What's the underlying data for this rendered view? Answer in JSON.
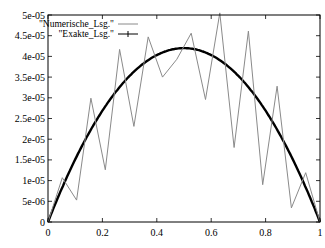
{
  "chart_data": {
    "type": "line",
    "title": "",
    "xlabel": "",
    "ylabel": "",
    "xlim": [
      0,
      1
    ],
    "ylim": [
      0,
      5e-05
    ],
    "grid": false,
    "legend_position": "top-left (inside)",
    "x_ticks": [
      0,
      0.2,
      0.4,
      0.6,
      0.8,
      1
    ],
    "x_tick_labels": [
      "0",
      "0.2",
      "0.4",
      "0.6",
      "0.8",
      "1"
    ],
    "y_ticks": [
      0,
      5e-06,
      1e-05,
      1.5e-05,
      2e-05,
      2.5e-05,
      3e-05,
      3.5e-05,
      4e-05,
      4.5e-05,
      5e-05
    ],
    "y_tick_labels": [
      "0",
      "5e-06",
      "1e-05",
      "1.5e-05",
      "2e-05",
      "2.5e-05",
      "3e-05",
      "3.5e-05",
      "4e-05",
      "4.5e-05",
      "5e-05"
    ],
    "series": [
      {
        "name": "\"Numerische_Lsg.\"",
        "style": "thin gray line",
        "color": "#888888",
        "x": [
          0,
          0.0526,
          0.1053,
          0.1579,
          0.2105,
          0.2632,
          0.3158,
          0.3684,
          0.4211,
          0.4737,
          0.5263,
          0.5789,
          0.6316,
          0.6842,
          0.7368,
          0.7895,
          0.8421,
          0.8947,
          0.9474,
          1
        ],
        "values": [
          0,
          1.07e-05,
          5.3e-06,
          2.99e-05,
          1.26e-05,
          4.17e-05,
          2.31e-05,
          4.47e-05,
          3.5e-05,
          3.93e-05,
          4.56e-05,
          2.96e-05,
          5.05e-05,
          1.8e-05,
          4.61e-05,
          9e-06,
          3.28e-05,
          3.4e-06,
          1.19e-05,
          0
        ]
      },
      {
        "name": "\"Exakte_Lsg.\"",
        "style": "thick black line with dense + markers",
        "color": "#000000",
        "function": "y = 1.68e-04 * x * (1 - x)",
        "peak": {
          "x": 0.5,
          "y": 4.2e-05
        }
      }
    ]
  },
  "legend": {
    "entries": [
      {
        "label": "\"Numerische_Lsg.\""
      },
      {
        "label": "\"Exakte_Lsg.\""
      }
    ]
  }
}
